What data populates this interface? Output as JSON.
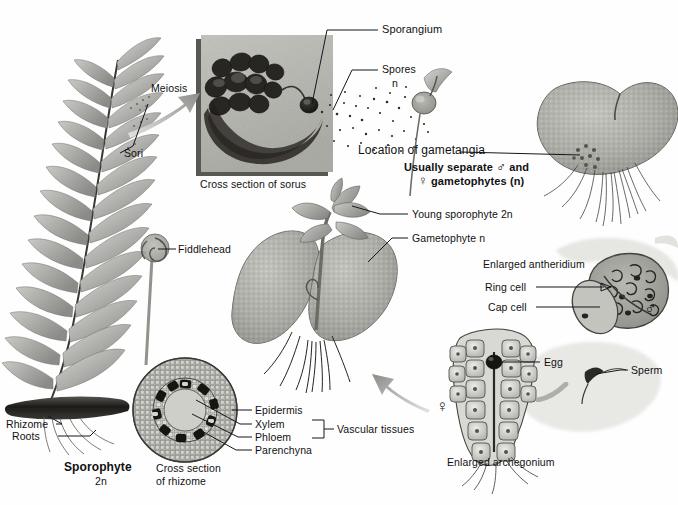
{
  "diagram": {
    "background_color": "#fefefe",
    "text_color": "#111111",
    "width": 678,
    "height": 505
  },
  "labels": {
    "meiosis": "Meiosis",
    "sori": "Sori",
    "sporangium": "Sporangium",
    "spores": "Spores",
    "spores_ploidy": "n",
    "cross_section_of_sorus": "Cross section of sorus",
    "location_of_gametangia": "Location of gametangia",
    "usually_separate_line1": "Usually separate",
    "usually_separate_and": "and",
    "usually_separate_line2": "gametophytes (n)",
    "fiddlehead": "Fiddlehead",
    "young_sporophyte": "Young sporophyte  2n",
    "gametophyte": "Gametophyte n",
    "enlarged_antheridium": "Enlarged antheridium",
    "ring_cell": "Ring cell",
    "cap_cell": "Cap cell",
    "egg": "Egg",
    "sperm": "Sperm",
    "enlarged_archegonium": "Enlarged archegonium",
    "rhizome": "Rhizome",
    "roots": "Roots",
    "sporophyte": "Sporophyte",
    "sporophyte_ploidy": "2n",
    "cross_section_of_rhizome_line1": "Cross section",
    "cross_section_of_rhizome_line2": "of rhizome",
    "epidermis": "Epidermis",
    "xylem": "Xylem",
    "phloem": "Phloem",
    "parenchyna": "Parenchyna",
    "vascular_tissues": "Vascular tissues",
    "male_symbol": "♂",
    "female_symbol": "♀"
  },
  "structures": {
    "fern_frond": "fern-frond-sporophyte",
    "sorus_inset": "sorus-cross-section-inset-photo",
    "spore_cloud": "dispersing-spores",
    "germinating_spore": "germinating-spore",
    "heart_gametophyte": "heart-shaped-gametophyte",
    "fiddlehead_coil": "fiddlehead-crozier",
    "young_sporophyte_plant": "young-sporophyte-on-gametophyte",
    "rhizome_mass": "rhizome-with-roots",
    "rhizome_cross_section": "rhizome-cross-section-circle",
    "antheridium": "enlarged-antheridium",
    "archegonium": "enlarged-archegonium",
    "sperm_cell": "swimming-sperm"
  },
  "arrows": {
    "meiosis_arrow": "meiosis-gray-arrow",
    "fertilization_arrow": "fertilization-gray-arrow",
    "sperm_to_egg_arrow": "sperm-to-archegonium-arrow"
  }
}
